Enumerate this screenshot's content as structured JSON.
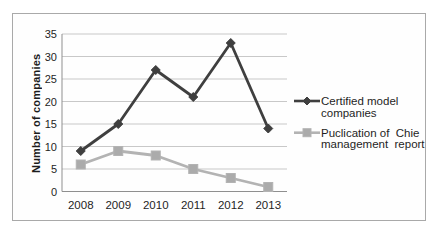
{
  "chart_data": {
    "type": "line",
    "title": "",
    "xlabel": "",
    "ylabel": "Number of companies",
    "categories": [
      "2008",
      "2009",
      "2010",
      "2011",
      "2012",
      "2013"
    ],
    "y_ticks": [
      0,
      5,
      10,
      15,
      20,
      25,
      30,
      35
    ],
    "ylim": [
      0,
      35
    ],
    "grid": true,
    "legend_position": "right",
    "series": [
      {
        "name": "Certified model companies",
        "legend_lines": [
          "Certified model",
          "companies"
        ],
        "values": [
          9,
          15,
          27,
          21,
          33,
          14
        ],
        "color": "#3f3f3f",
        "marker": "diamond",
        "marker_fill": "#3f3f3f"
      },
      {
        "name": "Puclication of Chie management report",
        "legend_lines": [
          "Puclication of  Chie",
          "management  report"
        ],
        "values": [
          6,
          9,
          8,
          5,
          3,
          1
        ],
        "color": "#b3b3b3",
        "marker": "square",
        "marker_fill": "#ababab"
      }
    ],
    "colors": {
      "gridline": "#c8c8c8",
      "axis": "#8f8f8f",
      "text": "#1f1f1f",
      "frame_border": "#a9a9a9"
    }
  }
}
